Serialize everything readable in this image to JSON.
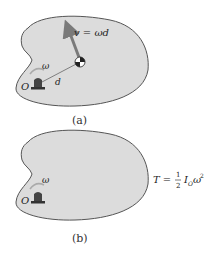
{
  "figure_a": {
    "caption": "(a)",
    "velocity_label": "v = ωd",
    "omega_label": "ω",
    "distance_label": "d",
    "pivot_label": "O"
  },
  "figure_b": {
    "caption": "(b)",
    "omega_label": "ω",
    "pivot_label": "O",
    "equation": {
      "lhs": "T =",
      "numerator": "1",
      "denominator": "2",
      "term": "I",
      "subscript": "O",
      "omega": "ω",
      "power": "2"
    }
  },
  "colors": {
    "body_fill": "#dcdcdc",
    "body_stroke": "#555555",
    "arrow": "#7a7a7a",
    "pivot": "#333333"
  }
}
